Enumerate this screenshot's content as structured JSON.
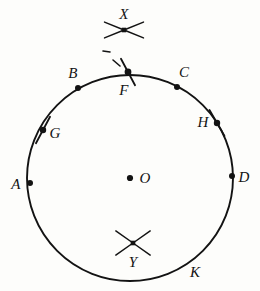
{
  "figure": {
    "type": "geometry-diagram",
    "width": 260,
    "height": 291,
    "background_color": "#fdfdfb",
    "ink_color": "#131313"
  },
  "circle": {
    "name": "main-circle",
    "center_x": 130,
    "center_y": 178,
    "radius": 103,
    "stroke_width": 1.9,
    "fill": "none"
  },
  "center_point": {
    "label": "O",
    "x": 130,
    "y": 178,
    "dot_radius": 3.1,
    "label_x": 145,
    "label_y": 178
  },
  "points": [
    {
      "id": "A",
      "label": "A",
      "x": 30,
      "y": 183,
      "dot_radius": 3.0,
      "label_x": 16,
      "label_y": 184,
      "has_tick": false
    },
    {
      "id": "B",
      "label": "B",
      "x": 78,
      "y": 88,
      "dot_radius": 3.0,
      "label_x": 73,
      "label_y": 73,
      "has_tick": false
    },
    {
      "id": "C",
      "label": "C",
      "x": 177,
      "y": 87,
      "dot_radius": 3.0,
      "label_x": 184,
      "label_y": 72,
      "has_tick": false
    },
    {
      "id": "D",
      "label": "D",
      "x": 232,
      "y": 176,
      "dot_radius": 3.0,
      "label_x": 244,
      "label_y": 177,
      "has_tick": false
    },
    {
      "id": "F",
      "label": "F",
      "x": 128,
      "y": 72,
      "dot_radius": 3.4,
      "label_x": 124,
      "label_y": 90,
      "has_tick": true,
      "tick_angle_deg": 62,
      "tick_length": 30
    },
    {
      "id": "G",
      "label": "G",
      "x": 43,
      "y": 130,
      "dot_radius": 3.2,
      "label_x": 55,
      "label_y": 133,
      "has_tick": true,
      "tick_angle_deg": 118,
      "tick_length": 30
    },
    {
      "id": "H",
      "label": "H",
      "x": 217,
      "y": 123,
      "dot_radius": 3.2,
      "label_x": 203,
      "label_y": 122,
      "has_tick": true,
      "tick_angle_deg": 60,
      "tick_length": 30
    }
  ],
  "arc_labels": [
    {
      "id": "K",
      "label": "K",
      "label_x": 195,
      "label_y": 272,
      "has_dot": false
    }
  ],
  "intersection_marks": [
    {
      "id": "X",
      "label": "X",
      "x": 124,
      "y": 30,
      "label_x": 124,
      "label_y": 14,
      "square_size": 4.6,
      "ray_length": 21,
      "ray_angles_deg": [
        22,
        158,
        202,
        338
      ],
      "position": "outside-circle-top"
    },
    {
      "id": "Y",
      "label": "Y",
      "x": 133,
      "y": 243,
      "label_x": 133,
      "label_y": 262,
      "square_size": 4.6,
      "ray_length": 21,
      "ray_angles_deg": [
        35,
        145,
        215,
        325
      ],
      "position": "inside-circle-bottom"
    }
  ],
  "guide_marks": [
    {
      "id": "dash-upper",
      "x1": 103,
      "y1": 51,
      "x2": 110,
      "y2": 52,
      "stroke_width": 1.6
    },
    {
      "id": "dash-lower",
      "x1": 113,
      "y1": 60,
      "x2": 120,
      "y2": 66,
      "stroke_width": 1.6
    }
  ]
}
